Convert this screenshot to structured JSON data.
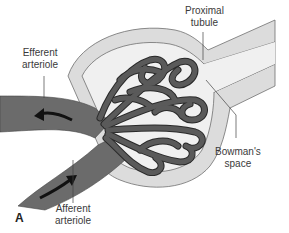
{
  "figure": {
    "panel_label": "A",
    "labels": {
      "efferent": [
        "Efferent",
        "arteriole"
      ],
      "proximal": [
        "Proximal",
        "tubule"
      ],
      "bowman": [
        "Bowman's",
        "space"
      ],
      "afferent": [
        "Afferent",
        "arteriole"
      ]
    },
    "arrows": {
      "efferent_flow": "outward (left)",
      "afferent_flow": "inward (up-right)"
    },
    "colors": {
      "vessel": "#6b6b6b",
      "capillary": "#5a5a5a",
      "capillary_outline": "#2a2a2a",
      "capsule_wall": "#dcdcdc",
      "capsule_outline": "#707070",
      "space": "#f0f0f0",
      "arrow": "#111111"
    }
  }
}
